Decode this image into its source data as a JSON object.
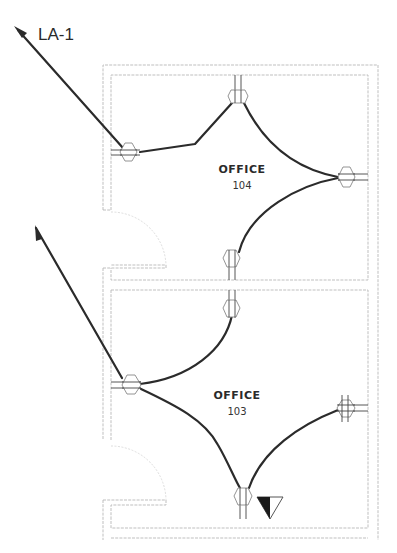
{
  "drawing": {
    "type": "electrical floor plan",
    "panel_label": "LA-1",
    "rooms": [
      {
        "name": "OFFICE",
        "number": "104"
      },
      {
        "name": "OFFICE",
        "number": "103"
      }
    ],
    "devices": [
      {
        "room": "104",
        "type": "duplex-receptacle",
        "wall": "left"
      },
      {
        "room": "104",
        "type": "duplex-receptacle",
        "wall": "top"
      },
      {
        "room": "104",
        "type": "duplex-receptacle",
        "wall": "right"
      },
      {
        "room": "104",
        "type": "duplex-receptacle",
        "wall": "bottom"
      },
      {
        "room": "103",
        "type": "duplex-receptacle",
        "wall": "top"
      },
      {
        "room": "103",
        "type": "duplex-receptacle",
        "wall": "left"
      },
      {
        "room": "103",
        "type": "quad-receptacle",
        "wall": "right"
      },
      {
        "room": "103",
        "type": "duplex-receptacle",
        "wall": "bottom"
      },
      {
        "room": "103",
        "type": "telephone-data-outlet",
        "wall": "bottom"
      }
    ],
    "home_runs": 2,
    "colors": {
      "wire": "#2b2b2b",
      "wall": "#b8b8b8",
      "device": "#888888"
    }
  }
}
